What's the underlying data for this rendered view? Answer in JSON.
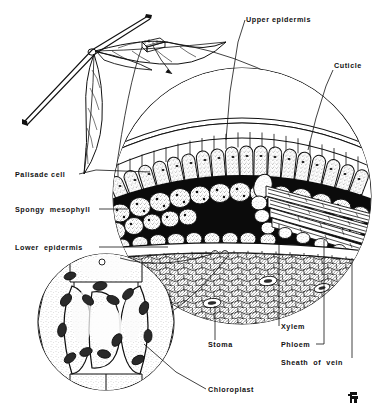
{
  "figure": {
    "background_color": "#ffffff",
    "ink_color": "#111111",
    "width": 379,
    "height": 416
  },
  "labels": {
    "upper_epidermis": "Upper epidermis",
    "cuticle": "Cuticle",
    "palisade_cell": "Palisade cell",
    "spongy_mesophyll": "Spongy  mesophyll",
    "lower_epidermis": "Lower  epidermis",
    "stoma": "Stoma",
    "xylem": "Xylem",
    "phloem": "Phloem",
    "sheath_of_vein": "Sheath  of  vein",
    "chloroplast": "Chloroplast"
  },
  "label_positions": [
    {
      "key": "upper_epidermis",
      "x": 246,
      "y": 22,
      "anchor": "start"
    },
    {
      "key": "cuticle",
      "x": 334,
      "y": 68,
      "anchor": "start"
    },
    {
      "key": "palisade_cell",
      "x": 15,
      "y": 177,
      "anchor": "start"
    },
    {
      "key": "spongy_mesophyll",
      "x": 15,
      "y": 212,
      "anchor": "start"
    },
    {
      "key": "lower_epidermis",
      "x": 15,
      "y": 250,
      "anchor": "start"
    },
    {
      "key": "stoma",
      "x": 208,
      "y": 347,
      "anchor": "start"
    },
    {
      "key": "xylem",
      "x": 281,
      "y": 329,
      "anchor": "start"
    },
    {
      "key": "phloem",
      "x": 281,
      "y": 347,
      "anchor": "start"
    },
    {
      "key": "sheath_of_vein",
      "x": 281,
      "y": 365,
      "anchor": "start"
    },
    {
      "key": "chloroplast",
      "x": 208,
      "y": 392,
      "anchor": "start"
    }
  ],
  "diagram_parts": {
    "twig_sprig": "twig-with-leaves",
    "magnifier_arrow": "arrow-from-leaf-to-cross-section",
    "main_circle": "leaf-cross-section-circle",
    "inset_circle": "guard-cell-stoma-inset-circle",
    "vascular_bundle": "vein-with-xylem-and-phloem",
    "signature": "artist-monogram"
  },
  "structures": {
    "palisade_rows": 1,
    "spongy_rows": 3,
    "epidermis_cells_top": 22,
    "epidermis_cells_bottom": 16,
    "stomata_visible": 3,
    "guard_cells_in_inset": 4
  }
}
